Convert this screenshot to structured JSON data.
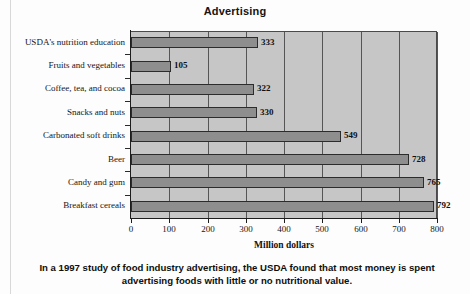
{
  "chart_data": {
    "type": "bar",
    "orientation": "horizontal",
    "title": "Advertising",
    "xlabel": "Million dollars",
    "ylabel": "",
    "xlim": [
      0,
      800
    ],
    "xticks": [
      "0",
      "100",
      "200",
      "300",
      "400",
      "500",
      "600",
      "700",
      "800"
    ],
    "grid": true,
    "legend": "none",
    "categories": [
      "USDA's nutrition education",
      "Fruits and vegetables",
      "Coffee, tea, and cocoa",
      "Snacks and nuts",
      "Carbonated soft drinks",
      "Beer",
      "Candy and gum",
      "Breakfast cereals"
    ],
    "values": [
      333,
      105,
      322,
      330,
      549,
      728,
      765,
      792
    ],
    "value_labels": [
      "333",
      "105",
      "322",
      "330",
      "549",
      "728",
      "765",
      "792"
    ],
    "colors": {
      "bar_fill": "#8e8e8e",
      "bar_border": "#2c2c2c",
      "plot_background": "#c6c6c6",
      "axis": "#1d1d1d",
      "gridline": "#555555",
      "text": "#141414",
      "page_background": "#fdfdfd"
    }
  },
  "caption": {
    "line1": "In a 1997 study of food industry advertising, the USDA found that most money is spent",
    "line2": "advertising foods with little or no nutritional value."
  }
}
